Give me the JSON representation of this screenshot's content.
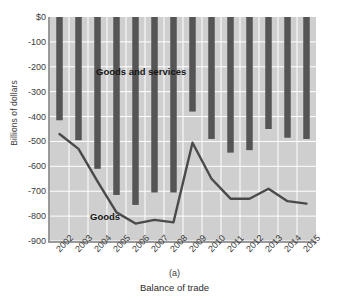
{
  "chart_data": {
    "type": "bar",
    "title": "",
    "subtitle": "",
    "panel_id": "(a)",
    "caption": "Balance of trade",
    "xlabel": "",
    "ylabel": "Billions of dollars",
    "categories": [
      "2002",
      "2003",
      "2004",
      "2005",
      "2006",
      "2007",
      "2008",
      "2009",
      "2010",
      "2011",
      "2012",
      "2013",
      "2014",
      "2015"
    ],
    "x_tick_labels": [
      "2002",
      "2003",
      "2004",
      "2005",
      "2006",
      "2007",
      "2008",
      "2009",
      "2010",
      "2011",
      "2012",
      "2013",
      "2014",
      "2015"
    ],
    "y_tick_labels": [
      "$0",
      "-100",
      "-200",
      "-300",
      "-400",
      "-500",
      "-600",
      "-700",
      "-800",
      "-900"
    ],
    "y_tick_values": [
      0,
      -100,
      -200,
      -300,
      -400,
      -500,
      -600,
      -700,
      -800,
      -900
    ],
    "ylim": [
      -900,
      0
    ],
    "grid": true,
    "grid_color": "#ffffff",
    "plot_background": "#cfcfcf",
    "legend_position": "inline-annotations",
    "series": [
      {
        "name": "Goods and services",
        "render": "bar",
        "color": "#555555",
        "label_text": "Goods and services",
        "values": [
          -415,
          -495,
          -610,
          -715,
          -755,
          -705,
          -705,
          -380,
          -490,
          -545,
          -535,
          -450,
          -485,
          -490
        ]
      },
      {
        "name": "Goods",
        "render": "line",
        "color": "#4a4a4a",
        "label_text": "Goods",
        "values": [
          -470,
          -530,
          -660,
          -785,
          -830,
          -815,
          -825,
          -505,
          -650,
          -730,
          -730,
          -690,
          -740,
          -750
        ]
      }
    ],
    "annotations": [
      {
        "text": "Goods and services",
        "x": "2003",
        "y": -220
      },
      {
        "text": "Goods",
        "x": "2004",
        "y": -805
      }
    ]
  }
}
